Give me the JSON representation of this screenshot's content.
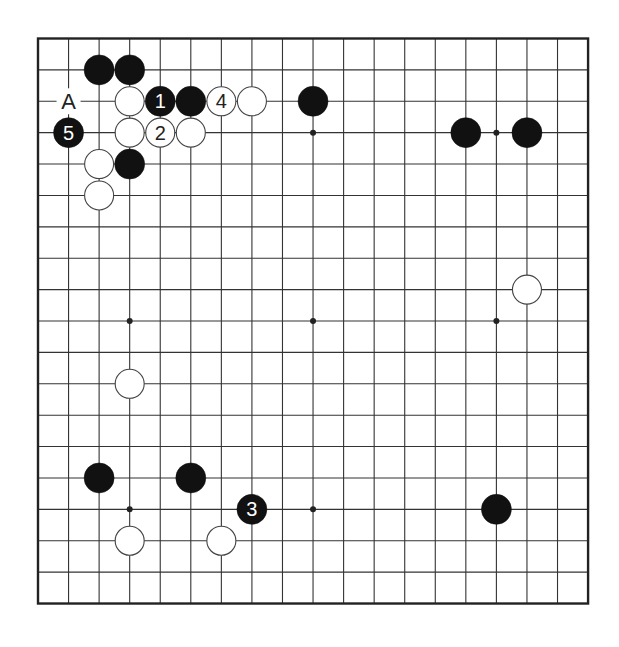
{
  "board": {
    "size": 19,
    "origin": {
      "x": 38,
      "y": 38.5
    },
    "spacing": {
      "x": 30.56,
      "y": 31.39
    },
    "stone_radius": 15,
    "colors": {
      "background": "#ffffff",
      "line": "#333333",
      "border": "#222222",
      "black_stone": "#111111",
      "white_stone": "#ffffff",
      "white_stone_outline": "#444444",
      "black_label": "#ffffff",
      "white_label": "#222222"
    },
    "star_points": [
      [
        3,
        3
      ],
      [
        9,
        3
      ],
      [
        15,
        3
      ],
      [
        3,
        9
      ],
      [
        9,
        9
      ],
      [
        15,
        9
      ],
      [
        3,
        15
      ],
      [
        9,
        15
      ],
      [
        15,
        15
      ]
    ]
  },
  "stones": [
    {
      "color": "black",
      "col": 2,
      "row": 1,
      "label": ""
    },
    {
      "color": "black",
      "col": 3,
      "row": 1,
      "label": ""
    },
    {
      "color": "white",
      "col": 3,
      "row": 2,
      "label": ""
    },
    {
      "color": "black",
      "col": 4,
      "row": 2,
      "label": "1"
    },
    {
      "color": "black",
      "col": 5,
      "row": 2,
      "label": ""
    },
    {
      "color": "white",
      "col": 6,
      "row": 2,
      "label": "4"
    },
    {
      "color": "white",
      "col": 7,
      "row": 2,
      "label": ""
    },
    {
      "color": "black",
      "col": 9,
      "row": 2,
      "label": ""
    },
    {
      "color": "black",
      "col": 1,
      "row": 3,
      "label": "5"
    },
    {
      "color": "white",
      "col": 3,
      "row": 3,
      "label": ""
    },
    {
      "color": "white",
      "col": 4,
      "row": 3,
      "label": "2"
    },
    {
      "color": "white",
      "col": 5,
      "row": 3,
      "label": ""
    },
    {
      "color": "black",
      "col": 14,
      "row": 3,
      "label": ""
    },
    {
      "color": "black",
      "col": 16,
      "row": 3,
      "label": ""
    },
    {
      "color": "white",
      "col": 2,
      "row": 4,
      "label": ""
    },
    {
      "color": "black",
      "col": 3,
      "row": 4,
      "label": ""
    },
    {
      "color": "white",
      "col": 2,
      "row": 5,
      "label": ""
    },
    {
      "color": "white",
      "col": 16,
      "row": 8,
      "label": ""
    },
    {
      "color": "white",
      "col": 3,
      "row": 11,
      "label": ""
    },
    {
      "color": "black",
      "col": 2,
      "row": 14,
      "label": ""
    },
    {
      "color": "black",
      "col": 5,
      "row": 14,
      "label": ""
    },
    {
      "color": "black",
      "col": 7,
      "row": 15,
      "label": "3"
    },
    {
      "color": "black",
      "col": 15,
      "row": 15,
      "label": ""
    },
    {
      "color": "white",
      "col": 3,
      "row": 16,
      "label": ""
    },
    {
      "color": "white",
      "col": 6,
      "row": 16,
      "label": ""
    }
  ],
  "markers": [
    {
      "col": 1,
      "row": 2,
      "label": "A"
    }
  ]
}
